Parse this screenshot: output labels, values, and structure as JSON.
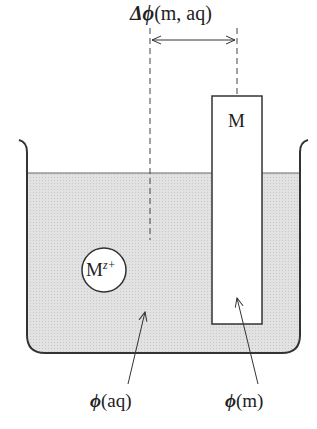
{
  "diagram": {
    "potential_difference_label": {
      "symbol": "Δϕ",
      "args": "(m, aq)"
    },
    "electrode_label": "M",
    "ion_label": {
      "base": "M",
      "charge": "z+"
    },
    "solution_potential_label": {
      "symbol": "ϕ",
      "args": "(aq)"
    },
    "metal_potential_label": {
      "symbol": "ϕ",
      "args": "(m)"
    },
    "colors": {
      "solution_fill": "#dcdcdc",
      "stroke": "#333333",
      "background": "#ffffff"
    }
  }
}
